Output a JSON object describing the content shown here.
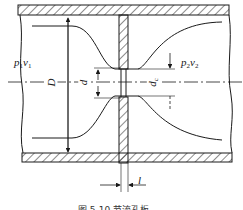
{
  "diagram": {
    "type": "orifice-plate-flow",
    "labels": {
      "upstream_p": "p",
      "upstream_p_sub": "1",
      "upstream_v": "v",
      "upstream_v_sub": "1",
      "downstream_p": "p",
      "downstream_p_sub": "2",
      "downstream_v": "v",
      "downstream_v_sub": "2",
      "pipe_diameter": "D",
      "orifice_diameter": "d",
      "contracted_diameter": "d",
      "contracted_diameter_sub": "c",
      "plate_thickness": "l"
    },
    "caption": "图 5-10  节流孔板",
    "colors": {
      "line": "#1a1a1a",
      "background": "#ffffff"
    }
  }
}
